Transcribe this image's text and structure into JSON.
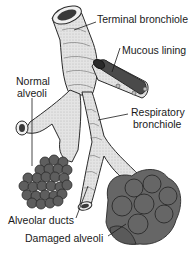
{
  "diagram": {
    "labels": {
      "terminal_bronchiole": "Terminal bronchiole",
      "mucous_lining": "Mucous lining",
      "normal_alveoli_1": "Normal",
      "normal_alveoli_2": "alveoli",
      "respiratory_bronchiole_1": "Respiratory",
      "respiratory_bronchiole_2": "bronchiole",
      "alveolar_ducts": "Alveolar ducts",
      "damaged_alveoli": "Damaged alveoli"
    },
    "colors": {
      "airway_fill": "#e6e6e6",
      "airway_shade": "#c9c9c9",
      "outline": "#2a2a2a",
      "alveoli_normal": "#5e5e5e",
      "alveoli_damaged": "#666666",
      "mucous": "#4a4a4a"
    }
  }
}
